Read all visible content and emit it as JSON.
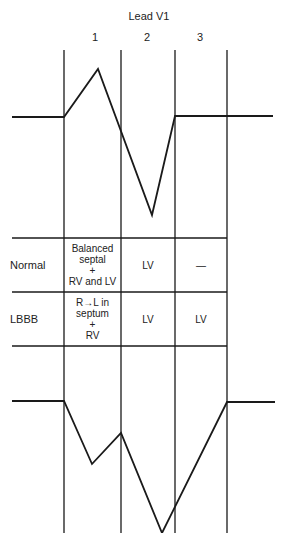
{
  "title": "Lead V1",
  "columns": [
    "1",
    "2",
    "3"
  ],
  "rows": [
    {
      "label": "Normal",
      "cells": [
        [
          "Balanced",
          "septal",
          "+",
          "RV and LV"
        ],
        [
          "LV"
        ],
        [
          "—"
        ]
      ]
    },
    {
      "label": "LBBB",
      "cells": [
        [
          "R→L in",
          "septum",
          "+",
          "RV"
        ],
        [
          "LV"
        ],
        [
          "LV"
        ]
      ]
    }
  ],
  "waveforms": {
    "normal": "12,117 64,117 98,69 152,215 175,116 273,116",
    "lbbb": "12,401 64,401 92,464 121,433 162,533 227,402 275,402"
  }
}
